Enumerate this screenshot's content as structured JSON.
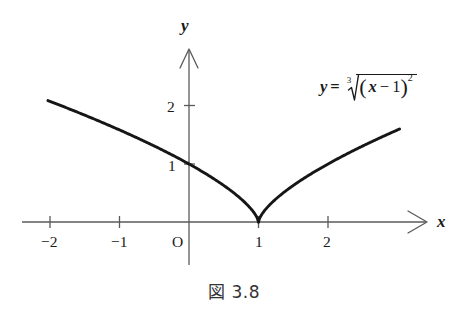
{
  "figure": {
    "caption": "図 3.8",
    "equation_plain": "y = 3√((x−1)^2)",
    "background_color": "#ffffff",
    "curve_color": "#161616",
    "axis_color": "#5a5a5a"
  },
  "equation": {
    "lhs": "y",
    "equals": "=",
    "root_index": "3",
    "open_paren": "(",
    "var": "x",
    "minus": "−",
    "one": "1",
    "close_paren": ")",
    "exponent": "2"
  },
  "axes": {
    "x_label": "x",
    "y_label": "y",
    "origin_label": "O",
    "x_ticks": [
      "−2",
      "−1",
      "1",
      "2"
    ],
    "y_ticks": [
      "1",
      "2"
    ]
  },
  "chart_data": {
    "type": "line",
    "title": "図 3.8",
    "annotations": [
      "y = ∛((x−1)²)"
    ],
    "xlabel": "x",
    "ylabel": "y",
    "xlim": [
      -2.4,
      3.4
    ],
    "ylim": [
      -0.45,
      2.95
    ],
    "xticks": [
      -2,
      -1,
      1,
      2
    ],
    "xticklabels": [
      "−2",
      "−1",
      "1",
      "2"
    ],
    "yticks": [
      1,
      2
    ],
    "yticklabels": [
      "1",
      "2"
    ],
    "grid": false,
    "legend": "none",
    "series": [
      {
        "name": "y = cbrt((x-1)^2)",
        "x": [
          -2.03,
          -1.9,
          -1.75,
          -1.6,
          -1.45,
          -1.3,
          -1.15,
          -1.0,
          -0.85,
          -0.7,
          -0.55,
          -0.4,
          -0.25,
          -0.1,
          0.05,
          0.2,
          0.35,
          0.5,
          0.65,
          0.8,
          0.9,
          0.95,
          1.0,
          1.05,
          1.1,
          1.2,
          1.35,
          1.5,
          1.65,
          1.8,
          1.95,
          2.1,
          2.25,
          2.4,
          2.55,
          2.7,
          2.85,
          3.03
        ],
        "y": [
          2.087,
          2.0,
          1.896,
          1.791,
          1.685,
          1.577,
          1.467,
          1.587,
          1.24,
          1.125,
          1.007,
          0.885,
          0.757,
          0.621,
          0.473,
          0.309,
          0.121,
          0.63,
          0.488,
          0.342,
          0.215,
          0.136,
          0.0,
          0.136,
          0.215,
          0.342,
          0.488,
          0.63,
          0.752,
          0.862,
          0.965,
          1.06,
          1.149,
          1.234,
          1.315,
          1.392,
          1.467,
          1.597
        ]
      }
    ],
    "function": "y = (x-1)^(2/3)",
    "cusp": {
      "x": 1,
      "y": 0
    },
    "notable_points": [
      {
        "x": -2,
        "y": 2.08
      },
      {
        "x": -1,
        "y": 1.587
      },
      {
        "x": 0,
        "y": 1.0
      },
      {
        "x": 1,
        "y": 0.0
      },
      {
        "x": 2,
        "y": 1.0
      },
      {
        "x": 3,
        "y": 1.587
      }
    ]
  }
}
